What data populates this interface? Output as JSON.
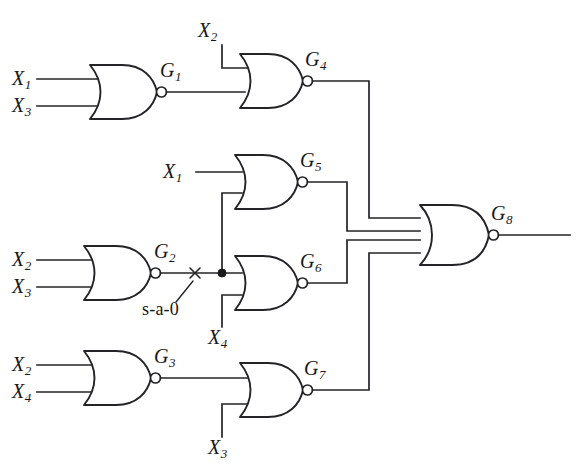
{
  "figure": {
    "name": "nor-gate-combinational-circuit-with-stuck-at-fault",
    "type": "logic-circuit-schematic",
    "width": 584,
    "height": 470,
    "background_color": "#ffffff",
    "line_color": "#242428"
  },
  "fault": {
    "label": "s-a-0",
    "meaning": "stuck-at-0",
    "marker": "x-cross",
    "on_net": "G2-output"
  },
  "gates": [
    {
      "id": "G1",
      "label": "G",
      "subscript": "1",
      "type": "NOR",
      "inputs": [
        "X1",
        "X3"
      ],
      "output_to": [
        "G4"
      ]
    },
    {
      "id": "G2",
      "label": "G",
      "subscript": "2",
      "type": "NOR",
      "inputs": [
        "X2",
        "X3"
      ],
      "output_to": [
        "G5",
        "G6"
      ]
    },
    {
      "id": "G3",
      "label": "G",
      "subscript": "3",
      "type": "NOR",
      "inputs": [
        "X2",
        "X4"
      ],
      "output_to": [
        "G7"
      ]
    },
    {
      "id": "G4",
      "label": "G",
      "subscript": "4",
      "type": "NOR",
      "inputs": [
        "X2",
        "G1"
      ],
      "output_to": [
        "G8"
      ]
    },
    {
      "id": "G5",
      "label": "G",
      "subscript": "5",
      "type": "NOR",
      "inputs": [
        "X1",
        "G2"
      ],
      "output_to": [
        "G8"
      ]
    },
    {
      "id": "G6",
      "label": "G",
      "subscript": "6",
      "type": "NOR",
      "inputs": [
        "G2",
        "X4"
      ],
      "output_to": [
        "G8"
      ]
    },
    {
      "id": "G7",
      "label": "G",
      "subscript": "7",
      "type": "NOR",
      "inputs": [
        "G3",
        "X3"
      ],
      "output_to": [
        "G8"
      ]
    },
    {
      "id": "G8",
      "label": "G",
      "subscript": "8",
      "type": "NOR",
      "inputs": [
        "G4",
        "G5",
        "G6",
        "G7"
      ],
      "output_to": [
        "primary-output"
      ]
    }
  ],
  "signals": {
    "x1_g1": {
      "label": "X",
      "subscript": "1"
    },
    "x3_g1": {
      "label": "X",
      "subscript": "3"
    },
    "x2_g4": {
      "label": "X",
      "subscript": "2"
    },
    "x1_g5": {
      "label": "X",
      "subscript": "1"
    },
    "x2_g2": {
      "label": "X",
      "subscript": "2"
    },
    "x3_g2": {
      "label": "X",
      "subscript": "3"
    },
    "x4_g6": {
      "label": "X",
      "subscript": "4"
    },
    "x2_g3": {
      "label": "X",
      "subscript": "2"
    },
    "x4_g3": {
      "label": "X",
      "subscript": "4"
    },
    "x3_g7": {
      "label": "X",
      "subscript": "3"
    }
  },
  "gate_labels": {
    "g1": {
      "label": "G",
      "subscript": "1"
    },
    "g2": {
      "label": "G",
      "subscript": "2"
    },
    "g3": {
      "label": "G",
      "subscript": "3"
    },
    "g4": {
      "label": "G",
      "subscript": "4"
    },
    "g5": {
      "label": "G",
      "subscript": "5"
    },
    "g6": {
      "label": "G",
      "subscript": "6"
    },
    "g7": {
      "label": "G",
      "subscript": "7"
    },
    "g8": {
      "label": "G",
      "subscript": "8"
    }
  }
}
